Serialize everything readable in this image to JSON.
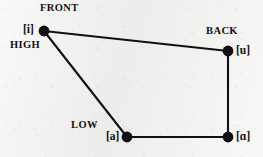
{
  "diagram": {
    "background_color": "#f1f1ef",
    "stroke_color": "#111111",
    "axis_labels": {
      "front": "FRONT",
      "back": "BACK",
      "high": "HIGH",
      "low": "LOW"
    },
    "vowels": [
      {
        "id": "i",
        "label": "[i]",
        "x": 44,
        "y": 31,
        "description": "high front"
      },
      {
        "id": "u",
        "label": "[u]",
        "x": 228,
        "y": 51,
        "description": "high back"
      },
      {
        "id": "a-low",
        "label": "[a]",
        "x": 127,
        "y": 137,
        "description": "low front"
      },
      {
        "id": "a-back",
        "label": "[ɑ]",
        "x": 228,
        "y": 137,
        "description": "low back"
      }
    ],
    "edges": [
      {
        "from": "i",
        "to": "u"
      },
      {
        "from": "u",
        "to": "a-back"
      },
      {
        "from": "a-back",
        "to": "a-low"
      },
      {
        "from": "a-low",
        "to": "i"
      }
    ],
    "node_radius": 5.2,
    "line_width": 2.1
  }
}
